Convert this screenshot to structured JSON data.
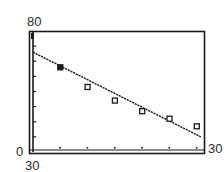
{
  "chart_data": {
    "type": "scatter",
    "title": "",
    "xlabel": "",
    "ylabel": "",
    "window_labels": {
      "ymax": "80",
      "ymin": "0",
      "xmin": "30",
      "xmax": "30"
    },
    "ylim": [
      0,
      80
    ],
    "y_tick_step": 10,
    "grid": false,
    "legend": null,
    "series": [
      {
        "name": "data points",
        "marker": "square",
        "points": [
          {
            "x": 1,
            "y": 56
          },
          {
            "x": 2,
            "y": 43
          },
          {
            "x": 3,
            "y": 34
          },
          {
            "x": 4,
            "y": 27
          },
          {
            "x": 5,
            "y": 22
          },
          {
            "x": 6,
            "y": 17
          }
        ]
      },
      {
        "name": "regression line",
        "type": "line",
        "points": [
          {
            "x": 0,
            "y": 66
          },
          {
            "x": 6,
            "y": 10
          }
        ]
      }
    ],
    "x_tick_count": 6
  },
  "colors": {
    "ink": "#1a1a1a",
    "background": "#ffffff"
  }
}
